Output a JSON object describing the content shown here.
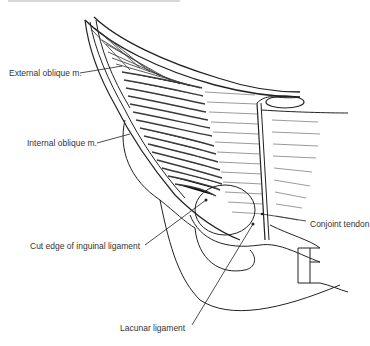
{
  "figure": {
    "type": "anatomical line drawing",
    "labels": [
      {
        "id": "external_oblique",
        "text": "External oblique m.",
        "x": 9,
        "y": 69
      },
      {
        "id": "internal_oblique",
        "text": "Internal oblique m.",
        "x": 27,
        "y": 138
      },
      {
        "id": "cut_edge_inguinal",
        "text": "Cut edge of inguinal ligament",
        "x": 30,
        "y": 241
      },
      {
        "id": "conjoint_tendon",
        "text": "Conjoint tendon",
        "x": 310,
        "y": 219
      },
      {
        "id": "lacunar_ligament",
        "text": "Lacunar ligament",
        "x": 120,
        "y": 323
      }
    ]
  },
  "colors": {
    "line": "#222222",
    "muscle_fill": "#555555",
    "label": "#333333",
    "background": "#ffffff"
  }
}
